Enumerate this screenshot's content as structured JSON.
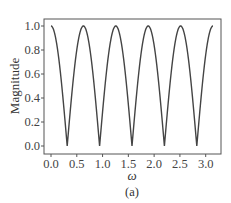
{
  "chart_data": {
    "type": "line",
    "title": "",
    "caption": "(a)",
    "xlabel": "ω",
    "ylabel": "Magnitude",
    "xlim": [
      0,
      3.1416
    ],
    "ylim": [
      0,
      1.0
    ],
    "xticks": [
      0.0,
      0.5,
      1.0,
      1.5,
      2.0,
      2.5,
      3.0
    ],
    "xtick_labels": [
      "0.0",
      "0.5",
      "1.0",
      "1.5",
      "2.0",
      "2.5",
      "3.0"
    ],
    "yticks": [
      0.0,
      0.2,
      0.4,
      0.6,
      0.8,
      1.0
    ],
    "ytick_labels": [
      "0.0",
      "0.2",
      "0.4",
      "0.6",
      "0.8",
      "1.0"
    ],
    "grid": false,
    "legend": null,
    "series": [
      {
        "name": "magnitude response",
        "formula": "|cos(5ω)|",
        "color": "#444444",
        "x": [
          0.0,
          0.314,
          0.628,
          0.942,
          1.257,
          1.571,
          1.885,
          2.199,
          2.513,
          2.827,
          3.142
        ],
        "values": [
          1.0,
          0.0,
          1.0,
          0.0,
          1.0,
          0.0,
          1.0,
          0.0,
          1.0,
          0.0,
          1.0
        ]
      }
    ]
  },
  "labels": {
    "xlabel": "ω",
    "ylabel": "Magnitude",
    "caption": "(a)"
  }
}
